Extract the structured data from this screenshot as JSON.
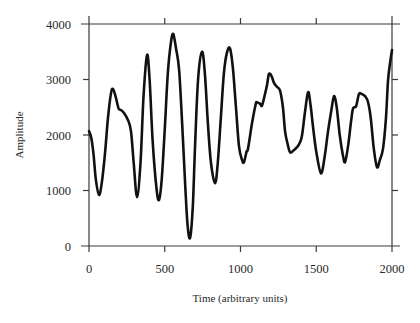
{
  "chart_data": {
    "type": "line",
    "title": "",
    "xlabel": "Time (arbitrary units)",
    "ylabel": "Amplitude",
    "xlim": [
      0,
      2000
    ],
    "ylim": [
      0,
      4000
    ],
    "xticks": [
      0,
      500,
      1000,
      1500,
      2000
    ],
    "yticks": [
      0,
      1000,
      2000,
      3000,
      4000
    ],
    "xtick_labels": [
      "0",
      "500",
      "1000",
      "1500",
      "2000"
    ],
    "ytick_labels": [
      "0",
      "1000",
      "2000",
      "3000",
      "4000"
    ],
    "grid": false,
    "legend": null,
    "series": [
      {
        "name": "Amplitude",
        "color": "#111111",
        "x": [
          0,
          15,
          30,
          45,
          66,
          85,
          105,
          125,
          145,
          158,
          175,
          195,
          211,
          230,
          257,
          277,
          295,
          317,
          340,
          360,
          383,
          400,
          420,
          445,
          462,
          480,
          500,
          520,
          540,
          556,
          575,
          595,
          615,
          635,
          650,
          667,
          685,
          700,
          720,
          746,
          765,
          785,
          805,
          832,
          850,
          870,
          890,
          910,
          931,
          950,
          970,
          990,
          1010,
          1023,
          1040,
          1050,
          1076,
          1100,
          1109,
          1130,
          1142,
          1162,
          1175,
          1188,
          1205,
          1221,
          1240,
          1261,
          1280,
          1294,
          1310,
          1327,
          1350,
          1373,
          1390,
          1406,
          1425,
          1446,
          1462,
          1479,
          1500,
          1531,
          1555,
          1578,
          1600,
          1617,
          1635,
          1655,
          1675,
          1690,
          1710,
          1730,
          1743,
          1763,
          1782,
          1800,
          1822,
          1842,
          1860,
          1880,
          1901,
          1920,
          1941,
          1960,
          1974,
          1990,
          2000
        ],
        "y": [
          2070,
          1950,
          1650,
          1200,
          920,
          1150,
          1650,
          2300,
          2750,
          2830,
          2700,
          2480,
          2450,
          2400,
          2270,
          2070,
          1500,
          880,
          1500,
          2700,
          3440,
          3000,
          1900,
          1050,
          830,
          1200,
          2100,
          3100,
          3650,
          3820,
          3550,
          3170,
          2200,
          1100,
          400,
          145,
          700,
          1800,
          3000,
          3500,
          3100,
          2200,
          1500,
          1130,
          1500,
          2300,
          3100,
          3480,
          3560,
          3200,
          2500,
          1800,
          1550,
          1510,
          1700,
          1760,
          2210,
          2550,
          2590,
          2560,
          2530,
          2740,
          2900,
          3100,
          3060,
          2940,
          2870,
          2800,
          2500,
          2070,
          1850,
          1690,
          1720,
          1780,
          1850,
          1990,
          2400,
          2770,
          2550,
          2140,
          1700,
          1310,
          1600,
          2070,
          2450,
          2700,
          2500,
          2000,
          1650,
          1510,
          1800,
          2250,
          2480,
          2520,
          2740,
          2740,
          2700,
          2590,
          2300,
          1750,
          1420,
          1550,
          1760,
          2300,
          2990,
          3350,
          3530
        ]
      }
    ]
  }
}
